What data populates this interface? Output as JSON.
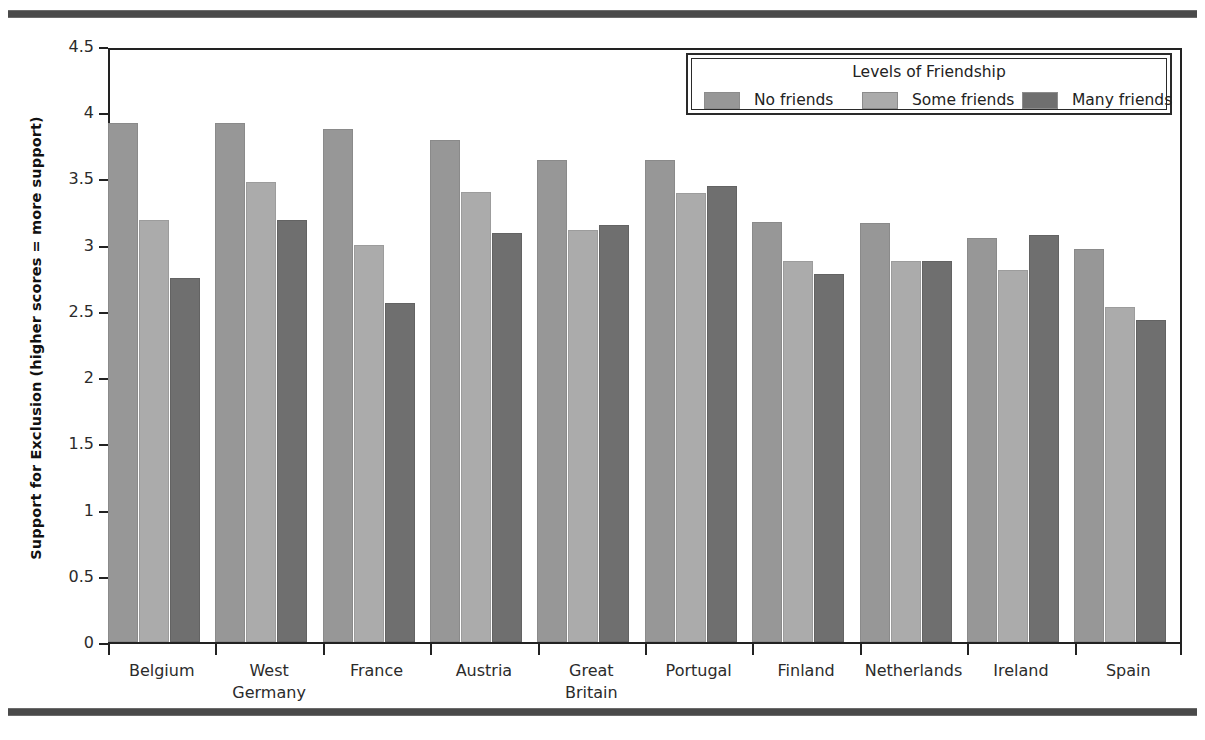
{
  "chart_data": {
    "type": "bar",
    "title": "",
    "subtitle": "",
    "xlabel": "",
    "ylabel": "Support for Exclusion (higher scores = more support)",
    "ylim": [
      0,
      4.5
    ],
    "yticks": [
      "0",
      "0.5",
      "1",
      "1.5",
      "2",
      "2.5",
      "3",
      "3.5",
      "4",
      "4.5"
    ],
    "ytick_values": [
      0,
      0.5,
      1,
      1.5,
      2,
      2.5,
      3,
      3.5,
      4,
      4.5
    ],
    "grid": false,
    "legend_position": "top-right",
    "legend_title": "Levels of Friendship",
    "categories": [
      "Belgium",
      "West Germany",
      "France",
      "Austria",
      "Great Britain",
      "Portugal",
      "Finland",
      "Netherlands",
      "Ireland",
      "Spain"
    ],
    "category_lines": [
      [
        "Belgium"
      ],
      [
        "West",
        "Germany"
      ],
      [
        "France"
      ],
      [
        "Austria"
      ],
      [
        "Great",
        "Britain"
      ],
      [
        "Portugal"
      ],
      [
        "Finland"
      ],
      [
        "Netherlands"
      ],
      [
        "Ireland"
      ],
      [
        "Spain"
      ]
    ],
    "series": [
      {
        "name": "No friends",
        "color": "#979797",
        "values": [
          3.92,
          3.92,
          3.87,
          3.79,
          3.64,
          3.64,
          3.17,
          3.16,
          3.05,
          2.97
        ]
      },
      {
        "name": "Some friends",
        "color": "#ababab",
        "values": [
          3.19,
          3.47,
          3.0,
          3.4,
          3.11,
          3.39,
          2.88,
          2.88,
          2.81,
          2.53
        ]
      },
      {
        "name": "Many friends",
        "color": "#6f6f6f",
        "values": [
          2.75,
          3.19,
          2.56,
          3.09,
          3.15,
          3.44,
          2.78,
          2.88,
          3.07,
          2.43
        ]
      }
    ]
  },
  "figure": {
    "top_rule": "",
    "bottom_rule": ""
  }
}
